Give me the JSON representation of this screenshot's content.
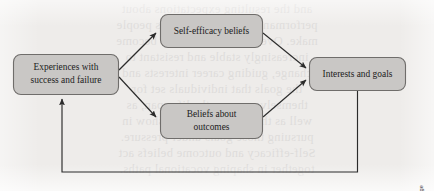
{
  "figure": {
    "background_color": "#eeecea",
    "node_fill": "#c9c7c5",
    "node_border": "#6f6d6b",
    "arrow_color": "#2b2b2b"
  },
  "nodes": {
    "experiences": {
      "id": "experiences",
      "line1": "Experiences with",
      "line2": "success and failure"
    },
    "self_efficacy": {
      "id": "self-efficacy",
      "line1": "Self-efficacy beliefs",
      "line2": ""
    },
    "beliefs_outcomes": {
      "id": "beliefs-about-outcomes",
      "line1": "Beliefs about",
      "line2": "outcomes"
    },
    "interests_goals": {
      "id": "interests-and-goals",
      "line1": "Interests and goals",
      "line2": ""
    }
  },
  "connections": [
    {
      "id": "experiences-to-self-efficacy",
      "from": "experiences",
      "to": "self_efficacy",
      "style": "arrow"
    },
    {
      "id": "experiences-to-beliefs-outcomes",
      "from": "experiences",
      "to": "beliefs_outcomes",
      "style": "arrow"
    },
    {
      "id": "self-efficacy-to-interests-goals",
      "from": "self_efficacy",
      "to": "interests_goals",
      "style": "arrow"
    },
    {
      "id": "beliefs-outcomes-to-interests-goals",
      "from": "beliefs_outcomes",
      "to": "interests_goals",
      "style": "arrow"
    },
    {
      "id": "interests-goals-to-experiences-feedback",
      "from": "interests_goals",
      "to": "experiences",
      "style": "feedback-arrow"
    }
  ],
  "credit": {
    "text": "© 2019 Cengage"
  },
  "bleed_text": {
    "lines": [
      "and the resulting expectations about",
      "performance shape the choices people",
      "make. Over time these beliefs become",
      "increasingly stable and resistant to",
      "change, guiding career interests and",
      "the goals that individuals set for",
      "themselves across the life span, as",
      "well as the persistence they show in",
      "pursuing those goals under pressure.",
      "Self-efficacy and outcome beliefs act",
      "together in shaping vocational paths."
    ]
  }
}
